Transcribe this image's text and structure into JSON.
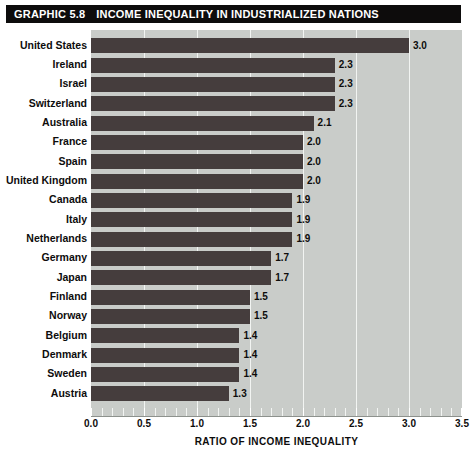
{
  "header": {
    "graphic_number": "GRAPHIC 5.8",
    "title": "INCOME INEQUALITY IN INDUSTRIALIZED NATIONS"
  },
  "colors": {
    "bar": "#453d3d",
    "plot_background": "#c9ccc9",
    "gridline": "#f2f4f2",
    "title_bar": "#0d0c0c",
    "text": "#0d0c0c",
    "page_background": "#ffffff"
  },
  "chart_data": {
    "type": "bar",
    "orientation": "horizontal",
    "title": "INCOME INEQUALITY IN INDUSTRIALIZED NATIONS",
    "xlabel": "RATIO OF INCOME INEQUALITY",
    "ylabel": "",
    "xlim": [
      0.0,
      3.5
    ],
    "xticks": [
      0.0,
      0.5,
      1.0,
      1.5,
      2.0,
      2.5,
      3.0,
      3.5
    ],
    "xtick_labels": [
      "0.0",
      "0.5",
      "1.0",
      "1.5",
      "2.0",
      "2.5",
      "3.0",
      "3.5"
    ],
    "grid": true,
    "grid_axis": "x",
    "legend": false,
    "data_labels": true,
    "categories": [
      "United States",
      "Ireland",
      "Israel",
      "Switzerland",
      "Australia",
      "France",
      "Spain",
      "United Kingdom",
      "Canada",
      "Italy",
      "Netherlands",
      "Germany",
      "Japan",
      "Finland",
      "Norway",
      "Belgium",
      "Denmark",
      "Sweden",
      "Austria"
    ],
    "values": [
      3.0,
      2.3,
      2.3,
      2.3,
      2.1,
      2.0,
      2.0,
      2.0,
      1.9,
      1.9,
      1.9,
      1.7,
      1.7,
      1.5,
      1.5,
      1.4,
      1.4,
      1.4,
      1.3
    ],
    "value_labels": [
      "3.0",
      "2.3",
      "2.3",
      "2.3",
      "2.1",
      "2.0",
      "2.0",
      "2.0",
      "1.9",
      "1.9",
      "1.9",
      "1.7",
      "1.7",
      "1.5",
      "1.5",
      "1.4",
      "1.4",
      "1.4",
      "1.3"
    ]
  }
}
